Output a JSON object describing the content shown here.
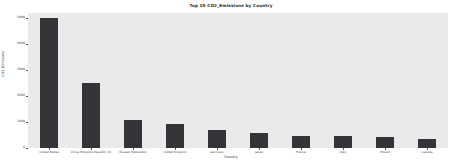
{
  "chart_data": {
    "type": "bar",
    "title": "Top 10 CO2_Emissions by Country",
    "xlabel": "Country",
    "ylabel": "CO2_Emissions",
    "categories": [
      "United States",
      "China (People's Republic of)",
      "Russian Federation",
      "United Kingdom",
      "Germany",
      "Japan",
      "France",
      "Italy",
      "Poland",
      "Canada"
    ],
    "values": [
      5000,
      2500,
      1060,
      940,
      700,
      590,
      470,
      450,
      430,
      360
    ],
    "ylim": [
      0,
      5200
    ],
    "yticks": [
      0,
      1000,
      2000,
      3000,
      4000,
      5000
    ],
    "ytick_labels": [
      "0",
      "1000",
      "2000",
      "3000",
      "4000",
      "5000"
    ],
    "grid": false,
    "legend": "none",
    "bar_color": "#333338",
    "plot_background": "#eaeaea",
    "figure_background": "#ffffff"
  }
}
